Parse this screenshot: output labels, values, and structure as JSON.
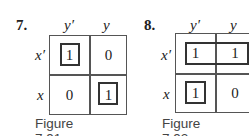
{
  "figures": [
    {
      "number": "7.",
      "col_labels": [
        "y′",
        "y"
      ],
      "row_labels": [
        "x′",
        "x"
      ],
      "cells": [
        [
          "1",
          "0"
        ],
        [
          "0",
          "1"
        ]
      ],
      "caption": "Figure 7.91"
    },
    {
      "number": "8.",
      "col_labels": [
        "y′",
        "y"
      ],
      "row_labels": [
        "x′",
        "x"
      ],
      "cells": [
        [
          "1",
          "1"
        ],
        [
          "1",
          "0"
        ]
      ],
      "caption": "Figure 7.92"
    }
  ]
}
